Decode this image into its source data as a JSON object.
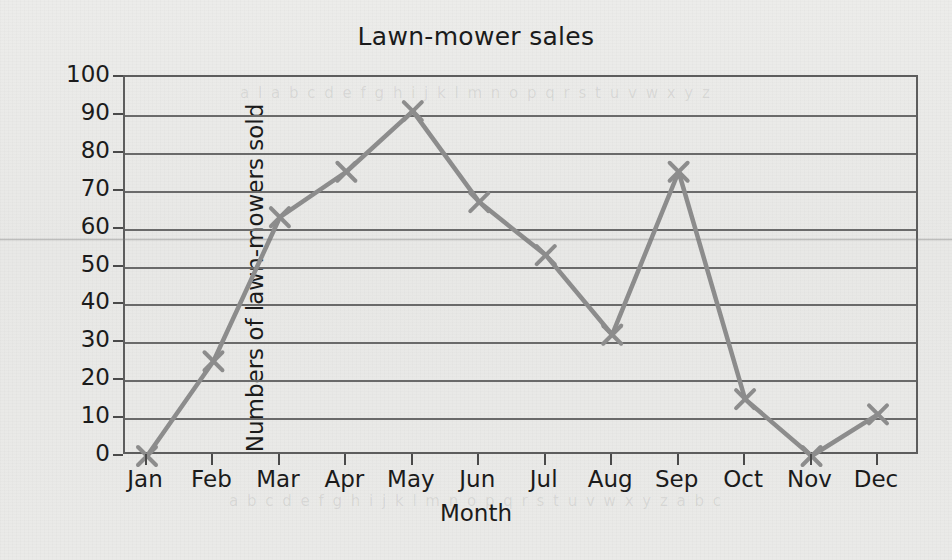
{
  "chart_data": {
    "type": "line",
    "title": "Lawn-mower sales",
    "xlabel": "Month",
    "ylabel": "Numbers of lawn-mowers sold",
    "categories": [
      "Jan",
      "Feb",
      "Mar",
      "Apr",
      "May",
      "Jun",
      "Jul",
      "Aug",
      "Sep",
      "Oct",
      "Nov",
      "Dec"
    ],
    "values": [
      0,
      25,
      63,
      75,
      91,
      67,
      53,
      32,
      75,
      15,
      0,
      11
    ],
    "series": [
      {
        "name": "Lawn-mower sales",
        "values": [
          0,
          25,
          63,
          75,
          91,
          67,
          53,
          32,
          75,
          15,
          0,
          11
        ]
      }
    ],
    "ylim": [
      0,
      100
    ],
    "ytick_labels": [
      "100",
      "90",
      "80",
      "70",
      "60",
      "50",
      "40",
      "30",
      "20",
      "10",
      "0"
    ],
    "ytick_values": [
      100,
      90,
      80,
      70,
      60,
      50,
      40,
      30,
      20,
      10,
      0
    ],
    "grid": true,
    "legend": false,
    "marker": "x",
    "line_color": "#8c8c8c",
    "grid_color": "#6a6a6a",
    "axis_color": "#5d5d5d",
    "text_color": "#1b1b1b",
    "background_color": "#e9e9e7"
  },
  "artifacts": {
    "bleed_top": "a l a b c d e f g h i j k l m n o p q r s t u v w x y z",
    "bleed_bottom": "a b c d e f g h i j k l m n o p q r s t u v w x y z a b c"
  }
}
